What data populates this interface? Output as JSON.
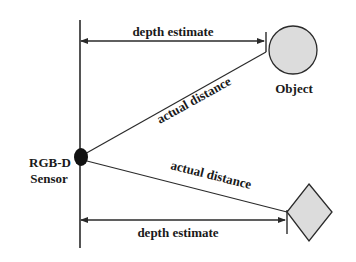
{
  "diagram": {
    "colors": {
      "stroke": "#2a2a2a",
      "sensor_fill": "#111111",
      "object_fill": "#dcdcdc",
      "background": "#ffffff"
    },
    "labels": {
      "top_depth_estimate": "depth estimate",
      "top_actual_distance": "actual distance",
      "object": "Object",
      "sensor_line1": "RGB-D",
      "sensor_line2": "Sensor",
      "bottom_actual_distance": "actual distance",
      "bottom_depth_estimate": "depth estimate"
    },
    "nodes": [
      {
        "id": "sensor",
        "shape": "ellipse",
        "label": "RGB-D Sensor"
      },
      {
        "id": "object-circle",
        "shape": "circle",
        "label": "Object"
      },
      {
        "id": "object-diamond",
        "shape": "diamond",
        "label": ""
      }
    ],
    "edges": [
      {
        "from": "sensor-plane",
        "to": "object-circle",
        "label": "depth estimate",
        "type": "horizontal-arrow"
      },
      {
        "from": "sensor",
        "to": "object-circle",
        "label": "actual distance",
        "type": "line"
      },
      {
        "from": "sensor",
        "to": "object-diamond",
        "label": "actual distance",
        "type": "line"
      },
      {
        "from": "sensor-plane",
        "to": "object-diamond",
        "label": "depth estimate",
        "type": "horizontal-arrow"
      }
    ]
  }
}
